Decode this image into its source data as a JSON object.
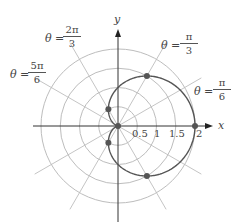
{
  "diagram": {
    "type": "polar-plot",
    "curve": "r = 1 + cos(theta)",
    "curve_name": "cardioid",
    "origin_px": [
      118,
      126
    ],
    "px_per_unit": 38.5,
    "rings": [
      0.5,
      1,
      1.5,
      2
    ],
    "radial_line_angles_deg": [
      0,
      30,
      60,
      90,
      120,
      150,
      180,
      210,
      240,
      270,
      300,
      330
    ],
    "radial_line_length": 2.5,
    "axes": {
      "x_label": "x",
      "y_label": "y"
    },
    "tick_labels": [
      {
        "value": 0.5,
        "text": "0.5"
      },
      {
        "value": 1,
        "text": "1"
      },
      {
        "value": 1.5,
        "text": "1.5"
      },
      {
        "value": 2,
        "text": "2"
      }
    ],
    "angle_labels": [
      {
        "prefix": "θ =",
        "num": "2π",
        "den": "3"
      },
      {
        "prefix": "θ =",
        "num": "5π",
        "den": "6"
      },
      {
        "prefix": "θ =",
        "num": "π",
        "den": "3"
      },
      {
        "prefix": "θ =",
        "num": "π",
        "den": "6"
      }
    ],
    "points": [
      {
        "theta": "0",
        "r": 2
      },
      {
        "theta": "π/3",
        "r": 1.5
      },
      {
        "theta": "-π/3",
        "r": 1.5
      },
      {
        "theta": "2π/3",
        "r": 0.5
      },
      {
        "theta": "-2π/3",
        "r": 0.5
      },
      {
        "theta": "π",
        "r": 0
      }
    ],
    "colors": {
      "grid": "#bdbdbd",
      "axis": "#333333",
      "curve": "#555555",
      "point": "#555555"
    }
  }
}
